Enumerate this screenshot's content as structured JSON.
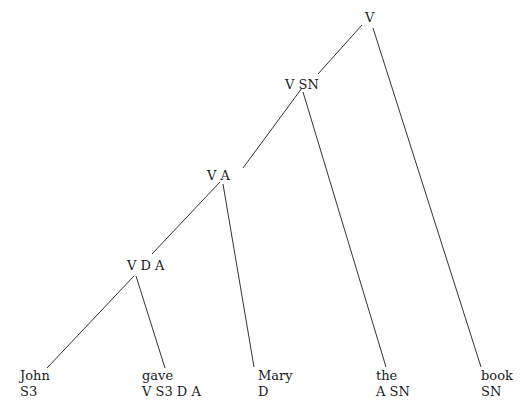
{
  "diagram": {
    "type": "categorial-grammar-derivation-tree",
    "nodes": [
      {
        "id": "root",
        "label": "V"
      },
      {
        "id": "n1",
        "label": "V SN"
      },
      {
        "id": "n2",
        "label": "V A"
      },
      {
        "id": "n3",
        "label": "V D A"
      }
    ],
    "leaves": [
      {
        "id": "john",
        "word": "John",
        "category": "S3"
      },
      {
        "id": "gave",
        "word": "gave",
        "category": "V S3 D A"
      },
      {
        "id": "mary",
        "word": "Mary",
        "category": "D"
      },
      {
        "id": "the",
        "word": "the",
        "category": "A SN"
      },
      {
        "id": "book",
        "word": "book",
        "category": "SN"
      }
    ],
    "edges": [
      [
        "root",
        "n1"
      ],
      [
        "root",
        "book"
      ],
      [
        "n1",
        "n2"
      ],
      [
        "n1",
        "the"
      ],
      [
        "n2",
        "n3"
      ],
      [
        "n2",
        "mary"
      ],
      [
        "n3",
        "john"
      ],
      [
        "n3",
        "gave"
      ]
    ],
    "colors": {
      "line": "#333333",
      "text": "#1a1a1a",
      "background": "#ffffff"
    }
  }
}
